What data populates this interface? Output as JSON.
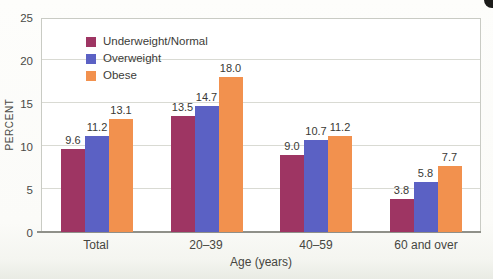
{
  "chart_data": {
    "type": "bar",
    "title": "",
    "xlabel": "Age (years)",
    "ylabel": "PERCENT",
    "categories": [
      "Total",
      "20–39",
      "40–59",
      "60 and over"
    ],
    "series": [
      {
        "name": "Underweight/Normal",
        "color": "#9e3563",
        "values": [
          9.6,
          13.5,
          9.0,
          3.8
        ]
      },
      {
        "name": "Overweight",
        "color": "#5b61c4",
        "values": [
          11.2,
          14.7,
          10.7,
          5.8
        ]
      },
      {
        "name": "Obese",
        "color": "#f2914e",
        "values": [
          13.1,
          18.0,
          11.2,
          7.7
        ]
      }
    ],
    "ylim": [
      0,
      25
    ],
    "yticks": [
      0,
      5,
      10,
      15,
      20,
      25
    ],
    "grid": true,
    "value_labels_decimals": 1,
    "legend_position": "top-left-inside"
  }
}
